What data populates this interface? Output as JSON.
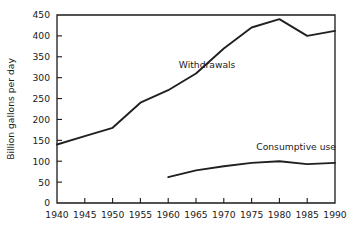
{
  "chart_data": {
    "type": "line",
    "title": "",
    "xlabel": "",
    "ylabel": "Billion gallons per day",
    "xlim": [
      1940,
      1990
    ],
    "ylim": [
      0,
      450
    ],
    "grid": false,
    "legend_position": "inline-annotation",
    "x_ticks": [
      1940,
      1945,
      1950,
      1955,
      1960,
      1965,
      1970,
      1975,
      1980,
      1985,
      1990
    ],
    "x_tick_labels": [
      "1940",
      "1945",
      "1950",
      "1955",
      "1960",
      "1965",
      "1970",
      "1975",
      "1980",
      "1985",
      "1990"
    ],
    "y_ticks": [
      0,
      50,
      100,
      150,
      200,
      250,
      300,
      350,
      400,
      450
    ],
    "y_tick_labels": [
      "0",
      "50",
      "100",
      "150",
      "200",
      "250",
      "300",
      "350",
      "400",
      "450"
    ],
    "series": [
      {
        "name": "Withdrawals",
        "label": "Withdrawals",
        "color": "#231f20",
        "label_x": 1967,
        "label_y": 322,
        "x": [
          1940,
          1945,
          1950,
          1955,
          1960,
          1965,
          1970,
          1975,
          1980,
          1985,
          1990
        ],
        "values": [
          140,
          160,
          180,
          240,
          270,
          310,
          370,
          420,
          440,
          400,
          412
        ]
      },
      {
        "name": "Consumptive use",
        "label": "Consumptive use",
        "color": "#231f20",
        "label_x": 1983,
        "label_y": 128,
        "x": [
          1960,
          1965,
          1970,
          1975,
          1980,
          1985,
          1990
        ],
        "values": [
          62,
          78,
          88,
          96,
          100,
          93,
          96
        ]
      }
    ]
  },
  "plot_geometry": {
    "left": 57,
    "right": 335,
    "top": 15,
    "bottom": 203
  }
}
